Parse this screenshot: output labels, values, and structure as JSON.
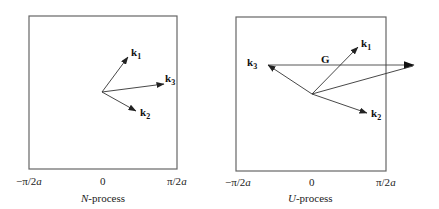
{
  "panels": [
    {
      "caption_italic": "N",
      "caption_rest": "-process",
      "ticks": {
        "left": "−π/2",
        "left_var": "a",
        "center": "0",
        "right": "π/2",
        "right_var": "a"
      },
      "vectors": [
        {
          "name": "k",
          "sub": "1"
        },
        {
          "name": "k",
          "sub": "3"
        },
        {
          "name": "k",
          "sub": "2"
        }
      ]
    },
    {
      "caption_italic": "U",
      "caption_rest": "-process",
      "ticks": {
        "left": "−π/2",
        "left_var": "a",
        "center": "0",
        "right": "π/2",
        "right_var": "a"
      },
      "vectors": [
        {
          "name": "k",
          "sub": "1"
        },
        {
          "name": "k",
          "sub": "3"
        },
        {
          "name": "k",
          "sub": "2"
        }
      ],
      "reciprocal_vector": "G"
    }
  ],
  "colors": {
    "box": "#555555",
    "arrow": "#222222",
    "text": "#222222"
  }
}
